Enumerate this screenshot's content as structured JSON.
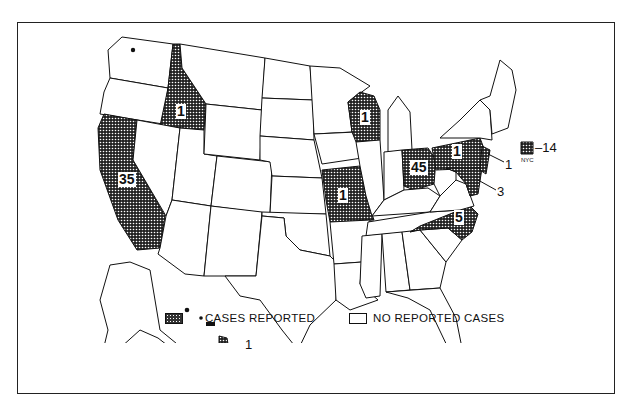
{
  "map": {
    "type": "choropleth",
    "region": "United States",
    "states_with_cases": [
      {
        "state": "California",
        "abbr": "CA",
        "cases": 35
      },
      {
        "state": "Idaho",
        "abbr": "ID",
        "cases": 1
      },
      {
        "state": "Wisconsin",
        "abbr": "WI",
        "cases": 1
      },
      {
        "state": "Missouri",
        "abbr": "MO",
        "cases": 1
      },
      {
        "state": "Ohio",
        "abbr": "OH",
        "cases": 45
      },
      {
        "state": "Pennsylvania",
        "abbr": "PA",
        "cases": 1
      },
      {
        "state": "New Jersey",
        "abbr": "NJ",
        "cases": 1
      },
      {
        "state": "Maryland/Delaware",
        "abbr": "MD",
        "cases": 3
      },
      {
        "state": "North Carolina",
        "abbr": "NC",
        "cases": 5
      },
      {
        "state": "Hawaii",
        "abbr": "HI",
        "cases": 1
      },
      {
        "state": "New York City",
        "abbr": "NYC",
        "cases": 14
      },
      {
        "state": "Washington",
        "abbr": "WA",
        "cases": null
      }
    ],
    "labels": {
      "ca": "35",
      "id": "1",
      "wi": "1",
      "mo": "1",
      "oh": "45",
      "pa": "1",
      "nc": "5",
      "nj": "1",
      "md": "3",
      "hi": "1",
      "nyc_value": "–14",
      "nyc_label": "NYC"
    }
  },
  "legend": {
    "cases_reported": "CASES REPORTED",
    "no_reported_cases": "NO REPORTED CASES"
  }
}
